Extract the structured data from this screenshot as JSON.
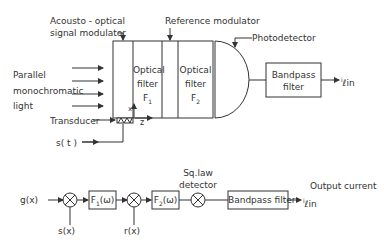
{
  "top_diagram": {
    "labels": {
      "acousto_optical": "Acousto - optical",
      "signal_modulator": "signal  modulator",
      "reference_modulator": "Reference  modulator",
      "photodetector": "Photodetector",
      "parallel": "Parallel",
      "monochromatic": "monochromatic",
      "light": "light",
      "optical_filter_1_a": "Optical",
      "optical_filter_1_b": "filter",
      "optical_filter_1_c": "F",
      "optical_filter_1_sub": "1",
      "optical_filter_2_a": "Optical",
      "optical_filter_2_b": "filter",
      "optical_filter_2_c": "F",
      "optical_filter_2_sub": "2",
      "bandpass_a": "Bandpass",
      "bandpass_b": "filter",
      "output": "ℓin",
      "output_prefix": "i",
      "transducer": "Transducer",
      "s_t": "s( t )",
      "axis_x": "x",
      "axis_z": "z"
    }
  },
  "bottom_diagram": {
    "labels": {
      "g_x": "g(x)",
      "s_x": "s(x)",
      "r_x": "r(x)",
      "f1": "F",
      "f1_sub": "1",
      "f1_arg": "(ω)",
      "f2": "F",
      "f2_sub": "2",
      "f2_arg": "(ω)",
      "sq_law_a": "Sq.law",
      "sq_law_b": "detector",
      "bandpass": "Bandpass filter",
      "output_current": "Output current",
      "output": "ℓin",
      "output_prefix": "i"
    }
  }
}
